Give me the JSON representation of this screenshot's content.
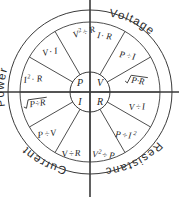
{
  "diagram": {
    "center": {
      "cx": 90,
      "cy": 92
    },
    "radii": {
      "outer": 82,
      "ring_inner": 70,
      "hub": 20
    },
    "colors": {
      "background": "#ffffff",
      "stroke": "#3a3a3a",
      "text": "#222222",
      "ring_text": "#2b2b2b"
    },
    "hub": {
      "quadrants": [
        {
          "symbol": "P",
          "position": "top-left"
        },
        {
          "symbol": "V",
          "position": "top-right"
        },
        {
          "symbol": "I",
          "position": "bottom-left"
        },
        {
          "symbol": "R",
          "position": "bottom-right"
        }
      ]
    },
    "quadrants": [
      {
        "name": "power",
        "label": "Power",
        "position": "top-left",
        "formulas": [
          {
            "id": "p-v2-over-r",
            "base": "V",
            "sup": "2",
            "op": "÷",
            "tail": "R",
            "display": "V²÷R"
          },
          {
            "id": "p-v-times-i",
            "base": "V",
            "sup": "",
            "op": "·",
            "tail": "I",
            "display": "V·I"
          },
          {
            "id": "p-i2-times-r",
            "base": "I",
            "sup": "2",
            "op": "·",
            "tail": "R",
            "display": "I²·R"
          }
        ]
      },
      {
        "name": "voltage",
        "label": "Voltage",
        "position": "top-right",
        "formulas": [
          {
            "id": "v-i-times-r",
            "base": "I",
            "sup": "",
            "op": "·",
            "tail": "R",
            "display": "I·R"
          },
          {
            "id": "v-p-over-i",
            "base": "P",
            "sup": "",
            "op": "÷",
            "tail": "I",
            "display": "P÷I"
          },
          {
            "id": "v-sqrt-p-times-r",
            "base": "",
            "sup": "",
            "op": "·",
            "tail": "",
            "display": "√(P·R)",
            "radical": true,
            "inner": "P·R"
          }
        ]
      },
      {
        "name": "current",
        "label": "Current",
        "position": "bottom-left",
        "formulas": [
          {
            "id": "i-sqrt-p-over-r",
            "base": "",
            "sup": "",
            "op": "÷",
            "tail": "",
            "display": "√(P÷R)",
            "radical": true,
            "inner": "P÷R"
          },
          {
            "id": "i-p-over-v",
            "base": "P",
            "sup": "",
            "op": "÷",
            "tail": "V",
            "display": "P÷V"
          },
          {
            "id": "i-v-over-r",
            "base": "V",
            "sup": "",
            "op": "÷",
            "tail": "R",
            "display": "V÷R"
          }
        ]
      },
      {
        "name": "resistance",
        "label": "Resistance",
        "position": "bottom-right",
        "formulas": [
          {
            "id": "r-v-over-i",
            "base": "V",
            "sup": "",
            "op": "÷",
            "tail": "I",
            "display": "V÷I"
          },
          {
            "id": "r-p-over-i2",
            "base": "P",
            "sup": "",
            "op": "÷",
            "tail": "I",
            "tailsup": "2",
            "display": "P÷I²"
          },
          {
            "id": "r-v2-over-p",
            "base": "V",
            "sup": "2",
            "op": "÷",
            "tail": "P",
            "display": "V²÷P"
          }
        ]
      }
    ]
  }
}
